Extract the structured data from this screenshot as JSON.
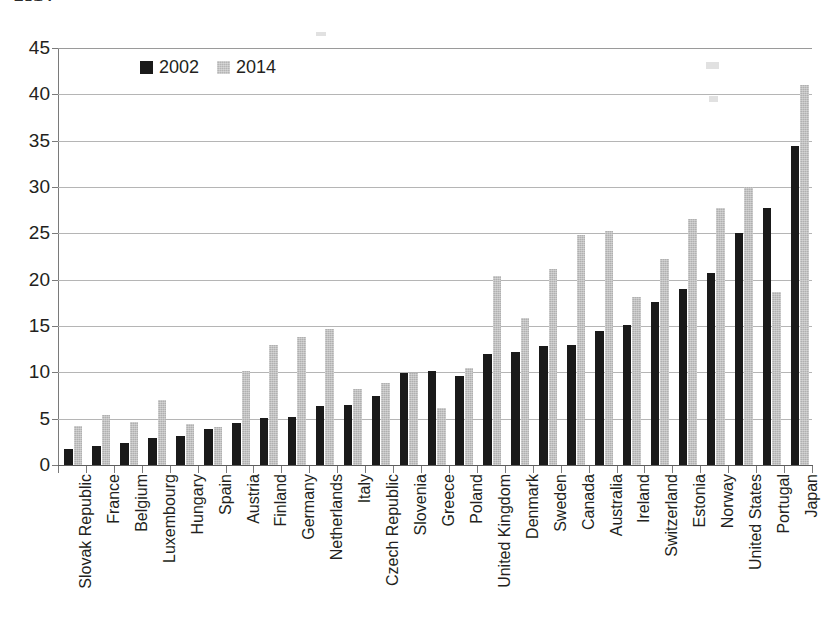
{
  "title_fragment": "2014",
  "legend": {
    "position": "top-left-inside",
    "entries": [
      {
        "label": "2002",
        "color": "#1a1a1a",
        "swatch": "legend-swatch-2002"
      },
      {
        "label": "2014",
        "color": "#b5b5b5",
        "swatch": "legend-swatch-2014"
      }
    ]
  },
  "chart_data": {
    "type": "bar",
    "title": "2014",
    "xlabel": "",
    "ylabel": "",
    "ylim": [
      0,
      45
    ],
    "yticks": [
      0,
      5,
      10,
      15,
      20,
      25,
      30,
      35,
      40,
      45
    ],
    "ytick_labels": [
      "0",
      "5",
      "10",
      "15",
      "20",
      "25",
      "30",
      "35",
      "40",
      "45"
    ],
    "grid": true,
    "legend_position": "upper left",
    "categories": [
      "Slovak Republic",
      "France",
      "Belgium",
      "Luxembourg",
      "Hungary",
      "Spain",
      "Austria",
      "Finland",
      "Germany",
      "Netherlands",
      "Italy",
      "Czech Republic",
      "Slovenia",
      "Greece",
      "Poland",
      "United Kingdom",
      "Denmark",
      "Sweden",
      "Canada",
      "Australia",
      "Ireland",
      "Switzerland",
      "Estonia",
      "Norway",
      "United States",
      "Portugal",
      "Japan"
    ],
    "series": [
      {
        "name": "2002",
        "color": "#1a1a1a",
        "values": [
          1.7,
          2.1,
          2.4,
          2.9,
          3.1,
          3.9,
          4.5,
          5.1,
          5.2,
          6.4,
          6.5,
          7.4,
          9.9,
          10.1,
          9.6,
          12.0,
          12.2,
          12.8,
          12.9,
          14.5,
          15.1,
          17.6,
          19.0,
          20.7,
          25.0,
          27.7,
          34.4
        ]
      },
      {
        "name": "2014",
        "color": "#b5b5b5",
        "values": [
          4.2,
          5.4,
          4.6,
          7.0,
          4.4,
          4.1,
          10.1,
          13.0,
          13.8,
          14.7,
          8.2,
          8.9,
          9.9,
          6.2,
          10.5,
          20.4,
          15.9,
          21.1,
          24.8,
          25.3,
          18.1,
          22.2,
          26.5,
          27.7,
          30.0,
          18.7,
          41.0
        ]
      }
    ]
  }
}
